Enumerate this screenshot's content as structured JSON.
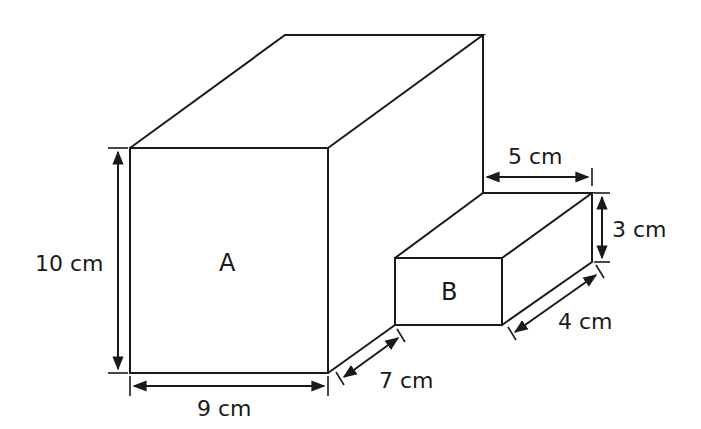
{
  "diagram": {
    "boxes": [
      {
        "id": "A",
        "label": "A",
        "height": "10 cm",
        "width": "9 cm",
        "depth": "7 cm"
      },
      {
        "id": "B",
        "label": "B",
        "height": "3 cm",
        "width": "5 cm",
        "depth": "4 cm"
      }
    ],
    "labels": {
      "a_label": "A",
      "b_label": "B",
      "a_height": "10 cm",
      "a_width": "9 cm",
      "a_depth": "7 cm",
      "b_width": "5 cm",
      "b_height": "3 cm",
      "b_depth": "4 cm"
    },
    "colors": {
      "stroke": "#1a1a1a",
      "background": "#ffffff"
    }
  }
}
